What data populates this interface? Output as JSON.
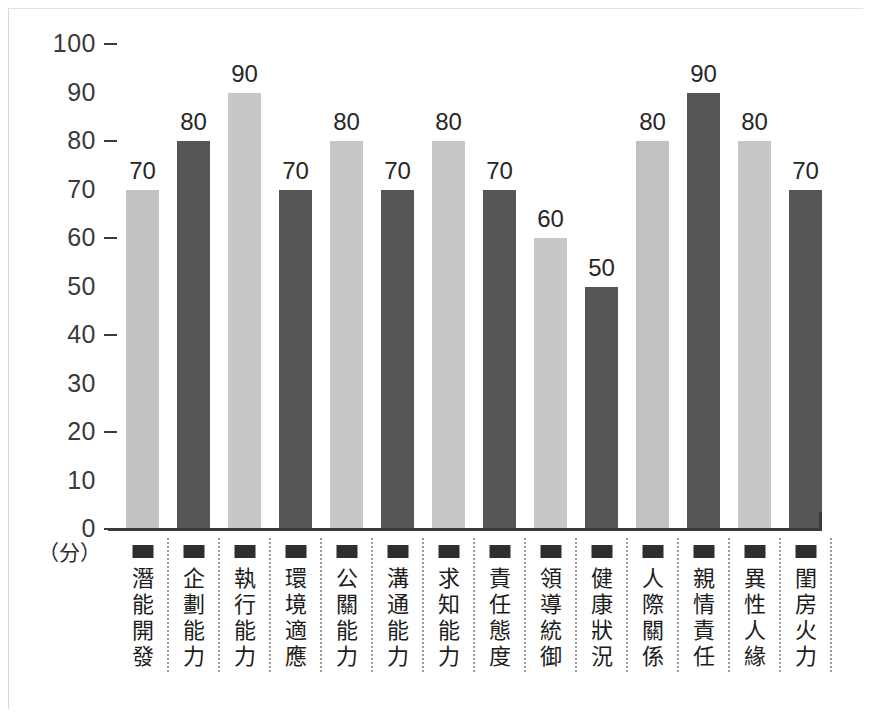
{
  "chart_data": {
    "type": "bar",
    "title": "",
    "subtitle": "",
    "xlabel": "",
    "ylabel": "",
    "unit_label": "（分）",
    "ylim": [
      0,
      100
    ],
    "y_ticks": [
      100,
      90,
      80,
      70,
      60,
      50,
      40,
      30,
      20,
      10,
      0
    ],
    "y_ticks_with_marks": [
      100,
      80,
      60,
      40,
      20,
      0
    ],
    "grid": false,
    "legend": "none",
    "categories": [
      "潛能開發",
      "企劃能力",
      "執行能力",
      "環境適應",
      "公關能力",
      "溝通能力",
      "求知能力",
      "責任態度",
      "領導統御",
      "健康狀況",
      "人際關係",
      "親情責任",
      "異性人緣",
      "閨房火力"
    ],
    "values": [
      70,
      80,
      90,
      70,
      80,
      70,
      80,
      70,
      60,
      50,
      80,
      90,
      80,
      70
    ],
    "bar_colors": [
      "#c2c2c2",
      "#565656",
      "#c7c7c7",
      "#565656",
      "#c7c7c7",
      "#565656",
      "#c7c7c7",
      "#565656",
      "#c7c7c7",
      "#565656",
      "#c2c2c2",
      "#565656",
      "#c7c7c7",
      "#565656"
    ],
    "value_labels": [
      "70",
      "80",
      "90",
      "70",
      "80",
      "70",
      "80",
      "70",
      "60",
      "50",
      "80",
      "90",
      "80",
      "70"
    ],
    "marker_color": "#2e2e2e",
    "axis_color": "#3a3a3a",
    "background": "#ffffff"
  }
}
